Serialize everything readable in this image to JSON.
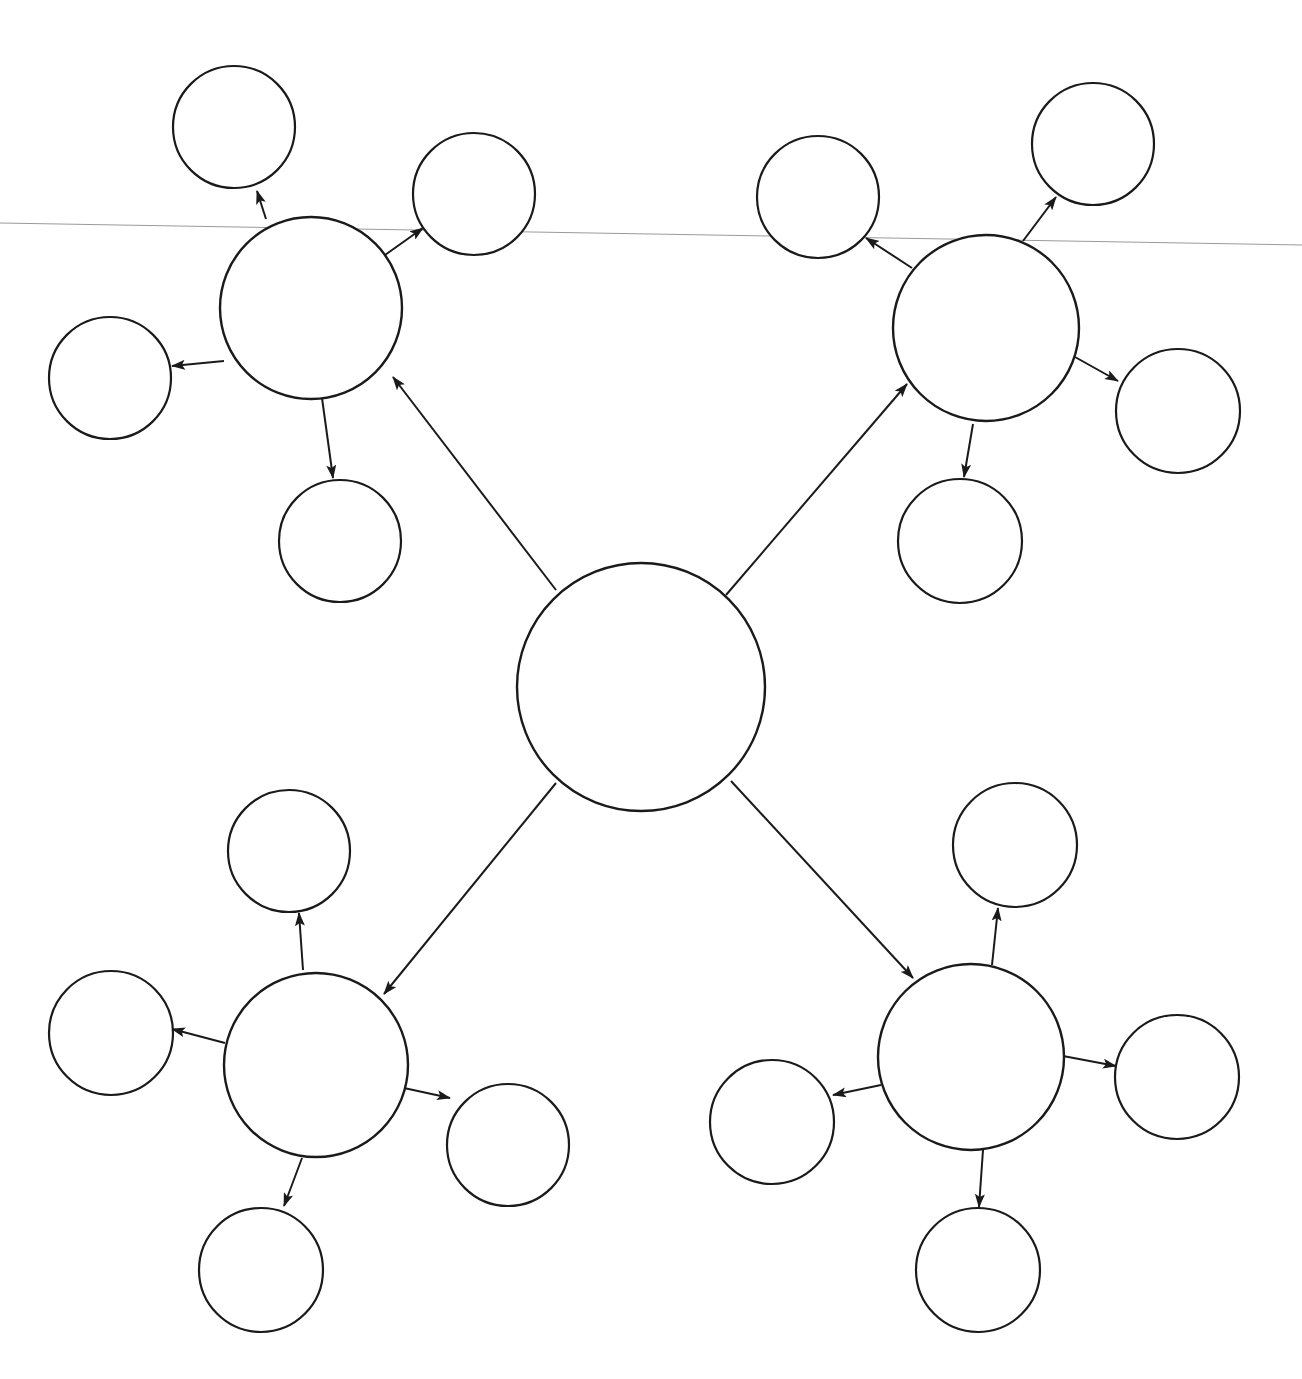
{
  "diagram": {
    "type": "bubble-map",
    "canvas": {
      "width": 1302,
      "height": 1379,
      "background": "#ffffff"
    },
    "colors": {
      "stroke": "#1a1a1a",
      "fill": "#ffffff",
      "scan_line": "#9a9a9a"
    },
    "artifact_line": {
      "x1": 0,
      "y1": 223,
      "x2": 1302,
      "y2": 245
    },
    "center": {
      "id": "center",
      "cx": 641,
      "cy": 687,
      "r": 124,
      "label": ""
    },
    "clusters": [
      {
        "id": "top-left",
        "hub": {
          "cx": 311,
          "cy": 308,
          "r": 91,
          "label": ""
        },
        "edge_from_center": {
          "x1": 556,
          "y1": 590,
          "x2": 393,
          "y2": 377
        },
        "satellites": [
          {
            "id": "tl-top",
            "cx": 234,
            "cy": 127,
            "r": 61,
            "label": "",
            "edge": {
              "x1": 266,
              "y1": 219,
              "x2": 257,
              "y2": 191
            }
          },
          {
            "id": "tl-right",
            "cx": 474,
            "cy": 194,
            "r": 61,
            "label": "",
            "edge": {
              "x1": 385,
              "y1": 255,
              "x2": 423,
              "y2": 228
            }
          },
          {
            "id": "tl-left",
            "cx": 110,
            "cy": 378,
            "r": 61,
            "label": "",
            "edge": {
              "x1": 224,
              "y1": 361,
              "x2": 172,
              "y2": 366
            }
          },
          {
            "id": "tl-bottom",
            "cx": 340,
            "cy": 541,
            "r": 61,
            "label": "",
            "edge": {
              "x1": 322,
              "y1": 398,
              "x2": 333,
              "y2": 478
            }
          }
        ]
      },
      {
        "id": "top-right",
        "hub": {
          "cx": 986,
          "cy": 328,
          "r": 93,
          "label": ""
        },
        "edge_from_center": {
          "x1": 726,
          "y1": 595,
          "x2": 907,
          "y2": 384
        },
        "satellites": [
          {
            "id": "tr-top-left",
            "cx": 818,
            "cy": 197,
            "r": 61,
            "label": "",
            "edge": {
              "x1": 912,
              "y1": 268,
              "x2": 866,
              "y2": 238
            }
          },
          {
            "id": "tr-top-right",
            "cx": 1093,
            "cy": 144,
            "r": 61,
            "label": "",
            "edge": {
              "x1": 1023,
              "y1": 241,
              "x2": 1056,
              "y2": 197
            }
          },
          {
            "id": "tr-right",
            "cx": 1178,
            "cy": 411,
            "r": 62,
            "label": "",
            "edge": {
              "x1": 1075,
              "y1": 357,
              "x2": 1118,
              "y2": 381
            }
          },
          {
            "id": "tr-bottom",
            "cx": 960,
            "cy": 541,
            "r": 62,
            "label": "",
            "edge": {
              "x1": 973,
              "y1": 424,
              "x2": 964,
              "y2": 477
            }
          }
        ]
      },
      {
        "id": "bottom-left",
        "hub": {
          "cx": 316,
          "cy": 1065,
          "r": 92,
          "label": ""
        },
        "edge_from_center": {
          "x1": 556,
          "y1": 783,
          "x2": 384,
          "y2": 994
        },
        "satellites": [
          {
            "id": "bl-top",
            "cx": 289,
            "cy": 851,
            "r": 61,
            "label": "",
            "edge": {
              "x1": 303,
              "y1": 970,
              "x2": 299,
              "y2": 913
            }
          },
          {
            "id": "bl-left",
            "cx": 111,
            "cy": 1033,
            "r": 62,
            "label": "",
            "edge": {
              "x1": 225,
              "y1": 1043,
              "x2": 172,
              "y2": 1029
            }
          },
          {
            "id": "bl-right",
            "cx": 508,
            "cy": 1145,
            "r": 61,
            "label": "",
            "edge": {
              "x1": 404,
              "y1": 1088,
              "x2": 450,
              "y2": 1098
            }
          },
          {
            "id": "bl-bottom",
            "cx": 261,
            "cy": 1270,
            "r": 62,
            "label": "",
            "edge": {
              "x1": 302,
              "y1": 1158,
              "x2": 284,
              "y2": 1206
            }
          }
        ]
      },
      {
        "id": "bottom-right",
        "hub": {
          "cx": 971,
          "cy": 1057,
          "r": 93,
          "label": ""
        },
        "edge_from_center": {
          "x1": 731,
          "y1": 781,
          "x2": 913,
          "y2": 978
        },
        "satellites": [
          {
            "id": "br-top",
            "cx": 1015,
            "cy": 845,
            "r": 62,
            "label": "",
            "edge": {
              "x1": 992,
              "y1": 965,
              "x2": 998,
              "y2": 908
            }
          },
          {
            "id": "br-left",
            "cx": 772,
            "cy": 1122,
            "r": 62,
            "label": "",
            "edge": {
              "x1": 881,
              "y1": 1085,
              "x2": 833,
              "y2": 1095
            }
          },
          {
            "id": "br-right",
            "cx": 1177,
            "cy": 1077,
            "r": 62,
            "label": "",
            "edge": {
              "x1": 1063,
              "y1": 1056,
              "x2": 1116,
              "y2": 1066
            }
          },
          {
            "id": "br-bottom",
            "cx": 978,
            "cy": 1270,
            "r": 62,
            "label": "",
            "edge": {
              "x1": 983,
              "y1": 1150,
              "x2": 979,
              "y2": 1207
            }
          }
        ]
      }
    ],
    "arrowhead": {
      "length": 14,
      "width": 9
    }
  }
}
